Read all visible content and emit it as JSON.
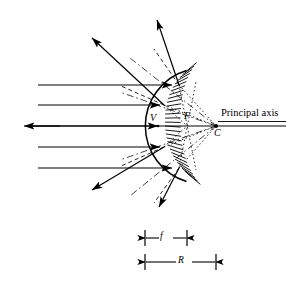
{
  "figure": {
    "kind": "convex-mirror-ray-diagram",
    "stroke_color": "#000000",
    "background": "#ffffff",
    "labels": {
      "vertex": "V",
      "focal_point": "F",
      "center_of_curvature": "C",
      "axis": "Principal axis",
      "focal_length": "f",
      "radius": "R"
    },
    "geometry": {
      "vertex": [
        158,
        126
      ],
      "focus": [
        187,
        126
      ],
      "center": [
        216,
        126
      ],
      "mirror_radius": 58,
      "axis_y": 126,
      "axis_x_start": 8,
      "axis_x_end": 286
    },
    "incoming_rays": [
      {
        "y": 85,
        "x_start": 38,
        "x_end": 178
      },
      {
        "y": 105,
        "x_start": 38,
        "x_end": 165
      },
      {
        "y": 126,
        "x_start": 12,
        "x_end": 158,
        "direction": "both"
      },
      {
        "y": 147,
        "x_start": 38,
        "x_end": 165
      },
      {
        "y": 168,
        "x_start": 38,
        "x_end": 178
      }
    ],
    "hit_points": [
      [
        179,
        85
      ],
      [
        164,
        105
      ],
      [
        158,
        126
      ],
      [
        164,
        147
      ],
      [
        179,
        168
      ]
    ],
    "reflected_rays": [
      {
        "from": [
          179,
          85
        ],
        "to": [
          156,
          14
        ]
      },
      {
        "from": [
          164,
          105
        ],
        "to": [
          89,
          35
        ]
      },
      {
        "from": [
          158,
          126
        ],
        "to": [
          13,
          126
        ]
      },
      {
        "from": [
          164,
          147
        ],
        "to": [
          89,
          194
        ]
      },
      {
        "from": [
          179,
          168
        ],
        "to": [
          158,
          212
        ]
      }
    ],
    "dimension_bars": [
      {
        "name": "f",
        "x_start": 145,
        "x_end": 187,
        "y": 238
      },
      {
        "name": "R",
        "x_start": 145,
        "x_end": 216,
        "y": 262
      }
    ]
  }
}
